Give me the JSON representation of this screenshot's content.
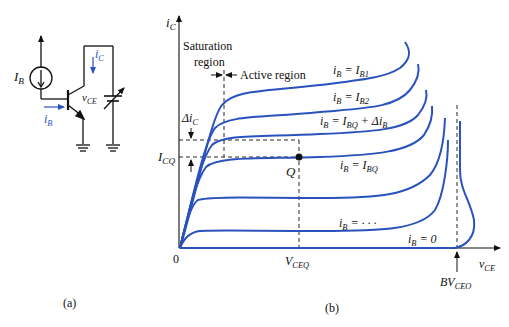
{
  "panel_a": {
    "caption": "(a)",
    "current_source_label": {
      "main": "I",
      "sub": "B"
    },
    "ib_label": {
      "main": "i",
      "sub": "B"
    },
    "ic_label": {
      "main": "i",
      "sub": "C"
    },
    "vce_label": {
      "main": "v",
      "sub": "CE"
    }
  },
  "panel_b": {
    "caption": "(b)",
    "y_axis_label": {
      "main": "i",
      "sub": "C"
    },
    "x_axis_label": {
      "main": "v",
      "sub": "CE"
    },
    "origin_label": "0",
    "saturation_region_line1": "Saturation",
    "saturation_region_line2": "region",
    "active_region_label": "Active region",
    "delta_ic_label": {
      "pre": "Δi",
      "sub": "C"
    },
    "icq_label": {
      "main": "I",
      "sub": "CQ"
    },
    "q_point_label": "Q",
    "vceq_label": {
      "main": "V",
      "sub": "CEQ"
    },
    "bvceo_label": {
      "main": "BV",
      "sub": "CEO"
    },
    "curves": [
      {
        "lhs": "i",
        "lhs_sub": "B",
        "rhs": "= I",
        "rhs_sub": "B1",
        "extra": ""
      },
      {
        "lhs": "i",
        "lhs_sub": "B",
        "rhs": "= I",
        "rhs_sub": "B2",
        "extra": ""
      },
      {
        "lhs": "i",
        "lhs_sub": "B",
        "rhs": "= I",
        "rhs_sub": "BQ",
        "extra": "+ Δi",
        "extra_sub": "B"
      },
      {
        "lhs": "i",
        "lhs_sub": "B",
        "rhs": "= I",
        "rhs_sub": "BQ",
        "extra": ""
      },
      {
        "lhs": "i",
        "lhs_sub": "B",
        "rhs": "= · · ·",
        "rhs_sub": "",
        "extra": ""
      },
      {
        "lhs": "i",
        "lhs_sub": "B",
        "rhs": "= 0",
        "rhs_sub": "",
        "extra": ""
      }
    ]
  },
  "colors": {
    "curve": "#2a52be",
    "ink": "#111111",
    "background": "#ffffff"
  }
}
